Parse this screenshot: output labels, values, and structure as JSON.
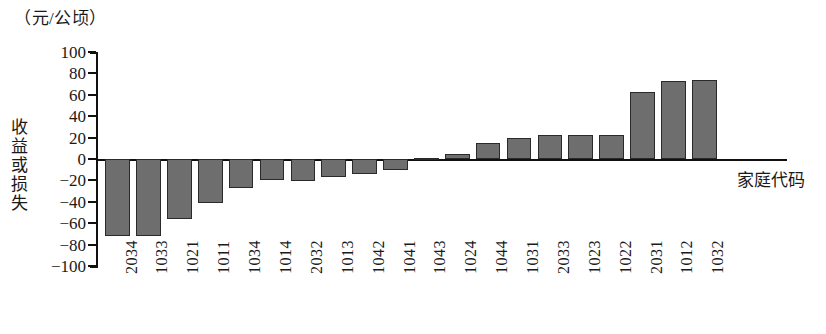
{
  "chart_data": {
    "type": "bar",
    "title": "",
    "unit_caption": "（元/公顷）",
    "xlabel": "家庭代码",
    "ylabel": "收益或损失",
    "ylim": [
      -100,
      100
    ],
    "ytick_labels": [
      "100",
      "80",
      "60",
      "40",
      "20",
      "0",
      "−20",
      "−40",
      "−60",
      "−80",
      "−100"
    ],
    "ytick_values": [
      100,
      80,
      60,
      40,
      20,
      0,
      -20,
      -40,
      -60,
      -80,
      -100
    ],
    "grid": false,
    "legend": "none",
    "bar_color": "#6e6e6e",
    "bar_edge_color": "#2a2a2a",
    "axis_color": "#111111",
    "categories": [
      "2034",
      "1033",
      "1021",
      "1011",
      "1034",
      "1014",
      "2032",
      "1013",
      "1042",
      "1041",
      "1043",
      "1024",
      "1044",
      "1031",
      "2033",
      "1023",
      "1022",
      "2031",
      "1012",
      "1032"
    ],
    "values": [
      -72,
      -72,
      -56,
      -41,
      -27,
      -20,
      -21,
      -17,
      -14,
      -10,
      1,
      5,
      15,
      20,
      22,
      22,
      22,
      63,
      73,
      74
    ]
  }
}
